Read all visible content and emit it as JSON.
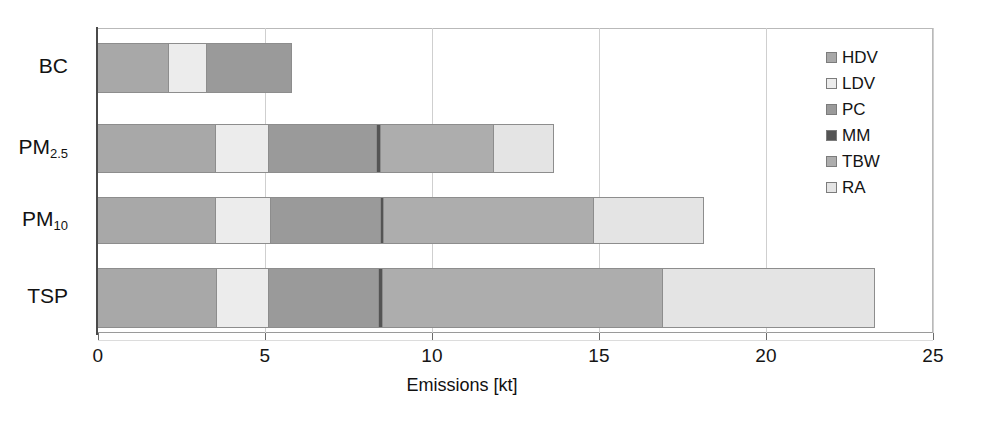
{
  "chart_data": {
    "type": "bar",
    "orientation": "horizontal",
    "stacked": true,
    "title": "",
    "subtitle": "",
    "xlabel": "Emissions [kt]",
    "ylabel": "",
    "xlim": [
      0,
      25
    ],
    "xticks": [
      0,
      5,
      10,
      15,
      20,
      25
    ],
    "xtick_labels": [
      "0",
      "5",
      "10",
      "15",
      "20",
      "25"
    ],
    "grid": true,
    "legend_position": "top-right",
    "categories": [
      "BC",
      "PM2.5",
      "PM10",
      "TSP"
    ],
    "category_labels_html": [
      "BC",
      "PM<sub>2.5</sub>",
      "PM<sub>10</sub>",
      "TSP"
    ],
    "series": [
      {
        "name": "HDV",
        "color": "#a8a8a8",
        "values": [
          2.1,
          3.5,
          3.5,
          3.55
        ]
      },
      {
        "name": "LDV",
        "color": "#ececec",
        "values": [
          1.15,
          1.6,
          1.65,
          1.55
        ]
      },
      {
        "name": "PC",
        "color": "#9a9a9a",
        "values": [
          2.55,
          3.25,
          3.3,
          3.3
        ]
      },
      {
        "name": "MM",
        "color": "#545454",
        "values": [
          0.0,
          0.1,
          0.1,
          0.1
        ]
      },
      {
        "name": "TBW",
        "color": "#adadad",
        "values": [
          0.0,
          3.4,
          6.3,
          8.4
        ]
      },
      {
        "name": "RA",
        "color": "#e4e4e4",
        "values": [
          0.0,
          1.8,
          3.3,
          6.35
        ]
      }
    ],
    "totals": [
      5.8,
      13.65,
      18.15,
      23.25
    ],
    "axis_colors": {
      "axis": "#4a4a4a",
      "grid": "#cfcfcf",
      "segment_border": "#8d8d8d"
    }
  },
  "legend": {
    "items": [
      {
        "label": "HDV",
        "color": "#a8a8a8"
      },
      {
        "label": "LDV",
        "color": "#ececec"
      },
      {
        "label": "PC",
        "color": "#9a9a9a"
      },
      {
        "label": "MM",
        "color": "#545454"
      },
      {
        "label": "TBW",
        "color": "#adadad"
      },
      {
        "label": "RA",
        "color": "#e4e4e4"
      }
    ]
  },
  "axis": {
    "x_title": "Emissions [kt]",
    "tick_labels": [
      "0",
      "5",
      "10",
      "15",
      "20",
      "25"
    ]
  }
}
